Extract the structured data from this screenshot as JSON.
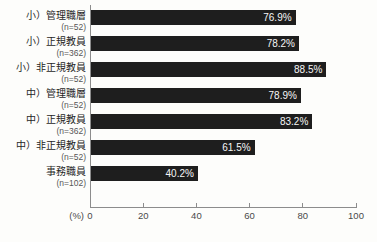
{
  "chart_data": {
    "type": "bar",
    "orientation": "horizontal",
    "title": "",
    "xlabel_unit": "(%)",
    "xlim": [
      0,
      100
    ],
    "xticks": [
      0,
      20,
      40,
      60,
      80,
      100
    ],
    "grid": false,
    "legend": false,
    "bar_color": "#1e1e1e",
    "value_label_color": "#f6f6f6",
    "categories": [
      "小）管理職層",
      "小）正規教員",
      "小）非正規教員",
      "中）管理職層",
      "中）正規教員",
      "中）非正規教員",
      "事務職員"
    ],
    "n_labels": [
      "(n=52)",
      "(n=362)",
      "(n=52)",
      "(n=52)",
      "(n=362)",
      "(n=52)",
      "(n=102)"
    ],
    "values": [
      76.9,
      78.2,
      88.5,
      78.9,
      83.2,
      61.5,
      40.2
    ],
    "value_labels": [
      "76.9%",
      "78.2%",
      "88.5%",
      "78.9%",
      "83.2%",
      "61.5%",
      "40.2%"
    ]
  }
}
